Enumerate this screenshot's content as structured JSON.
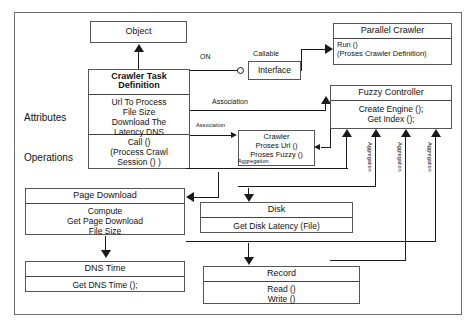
{
  "diagram": {
    "side_labels": {
      "attributes": "Attributes",
      "operations": "Operations"
    },
    "boxes": {
      "object": {
        "header": "Object"
      },
      "crawler_task_definition": {
        "header_line1": "Crawler Task",
        "header_line2": "Definition",
        "attributes": [
          "Url To Process",
          "File Size",
          "Download The",
          "Latency DNS"
        ],
        "operations": [
          "Call ()",
          "(Process Crawl",
          "Session () )"
        ]
      },
      "interface": {
        "stereotype": "Callable",
        "header": "Interface"
      },
      "parallel_crawler": {
        "header": "Parallel Crawler",
        "body": [
          "Run ()",
          "(Proses Crawler Definition)"
        ]
      },
      "fuzzy_controller": {
        "header": "Fuzzy Controller",
        "body": [
          "Create Engine ();",
          "Get Index ();"
        ]
      },
      "crawler": {
        "body": [
          "Crawler",
          "Proses Url ()",
          "Proses Fuzzy ()"
        ]
      },
      "page_download": {
        "header": "Page Download",
        "body": [
          "Compute",
          "Get Page Download",
          "File Size"
        ]
      },
      "disk": {
        "header": "Disk",
        "body": [
          "Get Disk Latency (File)"
        ]
      },
      "dns_time": {
        "header": "DNS Time",
        "body": [
          "Get DNS Time ();"
        ]
      },
      "record": {
        "header": "Record",
        "body": [
          "Read ()",
          "Write ()"
        ]
      }
    },
    "connector_labels": {
      "on": "ON",
      "association_1": "Association",
      "association_2": "Association",
      "aggregation_1": "Aggregation",
      "aggregation_2": "Aggregation",
      "aggregation_3": "Aggregation",
      "aggregation_4": "Aggregation"
    },
    "colors": {
      "stroke": "#1a1a1a",
      "box_border": "#555555",
      "frame": "#6b6b6b",
      "background": "#ffffff"
    }
  }
}
